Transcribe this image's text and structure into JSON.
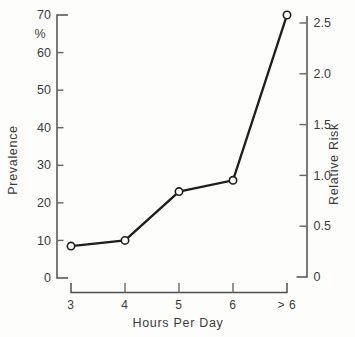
{
  "chart_data": {
    "type": "line",
    "title": "",
    "xlabel": "Hours Per Day",
    "categories": [
      "3",
      "4",
      "5",
      "6",
      ">6"
    ],
    "category_labels": [
      "3",
      "4",
      "5",
      "6",
      "> 6"
    ],
    "left_axis": {
      "label": "Prevalence",
      "unit_label": "%",
      "tick_labels": [
        "0",
        "10",
        "20",
        "30",
        "40",
        "50",
        "60",
        "70"
      ],
      "tick_values": [
        0,
        10,
        20,
        30,
        40,
        50,
        60,
        70
      ],
      "range": [
        0,
        70
      ]
    },
    "right_axis": {
      "label": "Relative Risk",
      "tick_labels": [
        "0",
        "0.5",
        "1.0",
        "1.5",
        "2.0",
        "2.5"
      ],
      "tick_values": [
        0,
        0.5,
        1.0,
        1.5,
        2.0,
        2.5
      ],
      "range": [
        0,
        2.6
      ]
    },
    "series": [
      {
        "name": "Prevalence",
        "axis": "left",
        "values": [
          8.5,
          10,
          23,
          26,
          70
        ],
        "values_on_right_axis": [
          0.32,
          0.37,
          0.85,
          0.96,
          2.6
        ],
        "marker": "open-circle"
      }
    ],
    "grid": false,
    "legend": "none",
    "colors": {
      "line": "#1e1e1e",
      "marker_fill": "#fdfdfc",
      "axis": "#4f4f4f",
      "text": "#3c3c3c",
      "background": "#fdfdfc"
    }
  }
}
